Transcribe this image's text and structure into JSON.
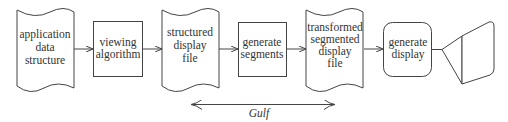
{
  "diagram": {
    "nodes": [
      {
        "id": "n1",
        "shape": "document",
        "lines": [
          "application",
          "data",
          "structure"
        ]
      },
      {
        "id": "n2",
        "shape": "box",
        "lines": [
          "viewing",
          "algorithm"
        ]
      },
      {
        "id": "n3",
        "shape": "document",
        "lines": [
          "structured",
          "display",
          "file"
        ]
      },
      {
        "id": "n4",
        "shape": "box",
        "lines": [
          "generate",
          "segments"
        ]
      },
      {
        "id": "n5",
        "shape": "document",
        "lines": [
          "transformed",
          "segmented",
          "display",
          "file"
        ]
      },
      {
        "id": "n6",
        "shape": "rounded-box",
        "lines": [
          "generate",
          "display"
        ]
      },
      {
        "id": "n7",
        "shape": "display-monitor",
        "lines": []
      }
    ],
    "edges": [
      {
        "from": "n1",
        "to": "n2"
      },
      {
        "from": "n2",
        "to": "n3"
      },
      {
        "from": "n3",
        "to": "n4"
      },
      {
        "from": "n4",
        "to": "n5"
      },
      {
        "from": "n5",
        "to": "n6"
      },
      {
        "from": "n6",
        "to": "n7"
      }
    ],
    "gulf": {
      "label": "Gulf",
      "type": "double-headed-arrow"
    }
  }
}
